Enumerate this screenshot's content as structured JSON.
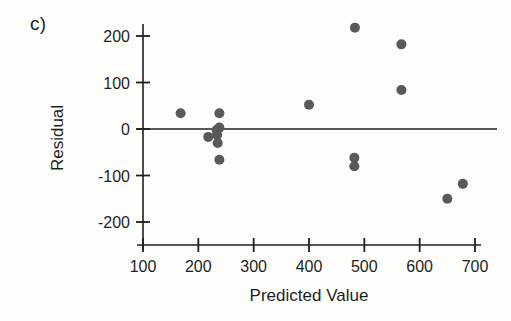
{
  "figure": {
    "panel_label": "c)",
    "background_color": "#fdfdfc",
    "ink_color": "#1f1f1f",
    "marker_color": "#595959"
  },
  "chart_data": {
    "type": "scatter",
    "title": "",
    "panel": "c)",
    "xlabel": "Predicted Value",
    "ylabel": "Residual",
    "xlim": [
      100,
      700
    ],
    "ylim": [
      -200,
      220
    ],
    "xticks": [
      100,
      200,
      300,
      400,
      500,
      600,
      700
    ],
    "yticks": [
      200,
      100,
      0,
      -100,
      -200
    ],
    "xtick_labels": [
      "100",
      "200",
      "300",
      "400",
      "500",
      "600",
      "700"
    ],
    "ytick_labels": [
      "200",
      "100",
      "0",
      "-100",
      "-200"
    ],
    "grid": false,
    "legend": null,
    "reference_line": {
      "orientation": "horizontal",
      "y": 0,
      "label": "zero residual line"
    },
    "marker": {
      "shape": "circle",
      "radius_px": 5,
      "color": "#595959"
    },
    "n_points": 16,
    "x": [
      168,
      218,
      233,
      234,
      235,
      238,
      238,
      238,
      400,
      483,
      482,
      482,
      567,
      567,
      650,
      678
    ],
    "y": [
      34,
      -17,
      -2,
      -13,
      -30,
      34,
      3,
      -66,
      52,
      218,
      -62,
      -80,
      182,
      84,
      -150,
      -118
    ],
    "points": [
      {
        "x": 168,
        "y": 34
      },
      {
        "x": 218,
        "y": -17
      },
      {
        "x": 233,
        "y": -2
      },
      {
        "x": 234,
        "y": -13
      },
      {
        "x": 235,
        "y": -30
      },
      {
        "x": 238,
        "y": 34
      },
      {
        "x": 238,
        "y": 3
      },
      {
        "x": 238,
        "y": -66
      },
      {
        "x": 400,
        "y": 52
      },
      {
        "x": 483,
        "y": 218
      },
      {
        "x": 482,
        "y": -62
      },
      {
        "x": 482,
        "y": -80
      },
      {
        "x": 567,
        "y": 182
      },
      {
        "x": 567,
        "y": 84
      },
      {
        "x": 650,
        "y": -150
      },
      {
        "x": 678,
        "y": -118
      }
    ]
  }
}
